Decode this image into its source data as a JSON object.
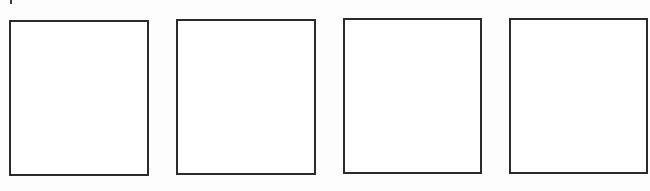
{
  "page": {
    "background_color": "#ffffff",
    "border_color": "#2b2b2b"
  },
  "marks": [
    {
      "name": "top-left-tick",
      "x": 10,
      "y": 0,
      "width": 2,
      "height": 4
    }
  ],
  "frames": [
    {
      "name": "frame-1",
      "x": 9,
      "y": 20,
      "width": 140,
      "height": 156,
      "content": ""
    },
    {
      "name": "frame-2",
      "x": 176,
      "y": 19,
      "width": 140,
      "height": 156,
      "content": ""
    },
    {
      "name": "frame-3",
      "x": 343,
      "y": 18,
      "width": 139,
      "height": 156,
      "content": ""
    },
    {
      "name": "frame-4",
      "x": 509,
      "y": 18,
      "width": 139,
      "height": 156,
      "content": ""
    }
  ]
}
